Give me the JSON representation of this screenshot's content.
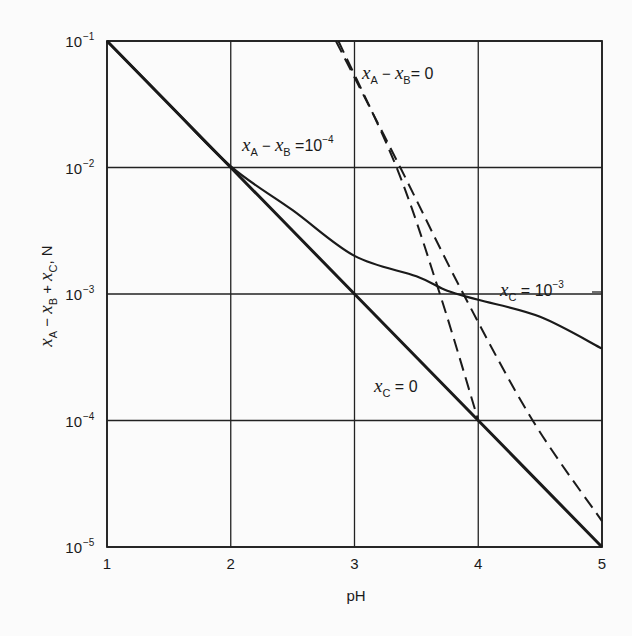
{
  "chart_data": {
    "type": "line",
    "title": "",
    "xlabel": "pH",
    "ylabel": "x_A − x_B + x_C, N",
    "xscale": "linear",
    "yscale": "log",
    "xlim": [
      1,
      5
    ],
    "ylim": [
      1e-05,
      0.1
    ],
    "grid": true,
    "legend": "none (curves labeled inline)",
    "x_ticks": [
      "1",
      "2",
      "3",
      "4",
      "5"
    ],
    "y_ticks": [
      {
        "base": "10",
        "exp": "−1",
        "value": 0.1
      },
      {
        "base": "10",
        "exp": "−2",
        "value": 0.01
      },
      {
        "base": "10",
        "exp": "−3",
        "value": 0.001
      },
      {
        "base": "10",
        "exp": "−4",
        "value": 0.0001
      },
      {
        "base": "10",
        "exp": "−5",
        "value": 1e-05
      }
    ],
    "series": [
      {
        "name": "x_C = 0, x_A − x_B = 0 (solid)",
        "style": "solid-thick",
        "x": [
          1,
          2,
          3,
          4,
          5
        ],
        "y": [
          0.1,
          0.01,
          0.001,
          0.0001,
          1e-05
        ]
      },
      {
        "name": "x_C = 10^-3, x_A − x_B = 0 (solid)",
        "style": "solid",
        "x": [
          1,
          1.5,
          2,
          2.5,
          3,
          3.5,
          3.75,
          4,
          4.5,
          5
        ],
        "y": [
          0.1,
          0.0317,
          0.0102,
          0.0046,
          0.002,
          0.00138,
          0.00106,
          0.0009,
          0.00066,
          0.00037
        ]
      },
      {
        "name": "x_A − x_B = 10^-4, x_C = 0 (dashed)",
        "style": "dashed",
        "x": [
          2.87,
          3.34,
          3.69,
          4.0
        ],
        "y": [
          0.1,
          0.01,
          0.001,
          0.0001
        ]
      },
      {
        "name": "x_A − x_B = 10^-4, x_C = 10^-3 (dashed)",
        "style": "dashed",
        "x": [
          2.85,
          3.37,
          3.88,
          4.44,
          5.0
        ],
        "y": [
          0.1,
          0.01,
          0.001,
          0.0001,
          1.6e-05
        ]
      }
    ],
    "annotations": [
      {
        "text": "x_A − x_B = 0",
        "near": [
          3.0,
          0.06
        ]
      },
      {
        "text": "x_A − x_B = 10^-4",
        "near": [
          2.1,
          0.02
        ]
      },
      {
        "text": "x_C = 10^-3",
        "near": [
          4.5,
          0.001
        ]
      },
      {
        "text": "x_C = 0",
        "near": [
          3.2,
          0.00025
        ]
      }
    ]
  },
  "labels": {
    "xlabel": "pH",
    "ylabel_parts": {
      "a": "x",
      "a_sub": "A",
      "minus": " − ",
      "b": "x",
      "b_sub": "B",
      "plus": " + ",
      "c": "x",
      "c_sub": "C",
      "unit": ", N"
    },
    "ann_ab0": {
      "x": "x",
      "sub1": "A",
      "mid": " − ",
      "x2": "x",
      "sub2": "B",
      "eq": "= 0"
    },
    "ann_ab4": {
      "x": "x",
      "sub1": "A",
      "mid": " − ",
      "x2": "x",
      "sub2": "B",
      "eq": " =10",
      "exp": "−4"
    },
    "ann_c3": {
      "x": "x",
      "sub": "C",
      "eq": " = 10",
      "exp": "−3"
    },
    "ann_c0": {
      "x": "x",
      "sub": "C",
      "eq": " = 0"
    }
  }
}
